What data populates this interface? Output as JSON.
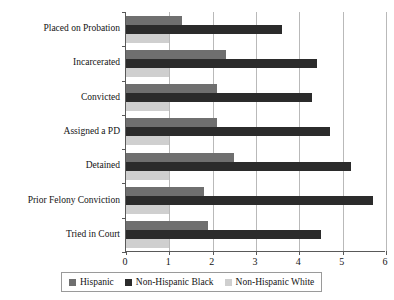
{
  "chart_data": {
    "type": "bar",
    "orientation": "horizontal",
    "title": "",
    "subtitle": "",
    "xlabel": "",
    "ylabel": "",
    "xlim": [
      0,
      6
    ],
    "xticks": [
      "0",
      "1",
      "2",
      "3",
      "4",
      "5",
      "6"
    ],
    "grid": true,
    "legend_position": "bottom",
    "categories": [
      "Placed on Probation",
      "Incarcerated",
      "Convicted",
      "Assigned a PD",
      "Detained",
      "Prior Felony Conviction",
      "Tried in Court"
    ],
    "series": [
      {
        "name": "Hispanic",
        "color": "#6f6f6f",
        "values": [
          1.3,
          2.3,
          2.1,
          2.1,
          2.5,
          1.8,
          1.9
        ]
      },
      {
        "name": "Non-Hispanic Black",
        "color": "#2b2b2b",
        "values": [
          3.6,
          4.4,
          4.3,
          4.7,
          5.2,
          5.7,
          4.5
        ]
      },
      {
        "name": "Non-Hispanic White",
        "color": "#cfcfcf",
        "values": [
          1.0,
          1.0,
          1.0,
          1.0,
          1.0,
          1.0,
          1.0
        ]
      }
    ]
  },
  "legend": {
    "entries": [
      {
        "label": "Hispanic",
        "color": "#6f6f6f"
      },
      {
        "label": "Non-Hispanic Black",
        "color": "#2b2b2b"
      },
      {
        "label": "Non-Hispanic White",
        "color": "#cfcfcf"
      }
    ]
  },
  "colors": {
    "axis": "#595959",
    "grid": "#b9b9b9",
    "background": "#ffffff",
    "text": "#141414"
  }
}
